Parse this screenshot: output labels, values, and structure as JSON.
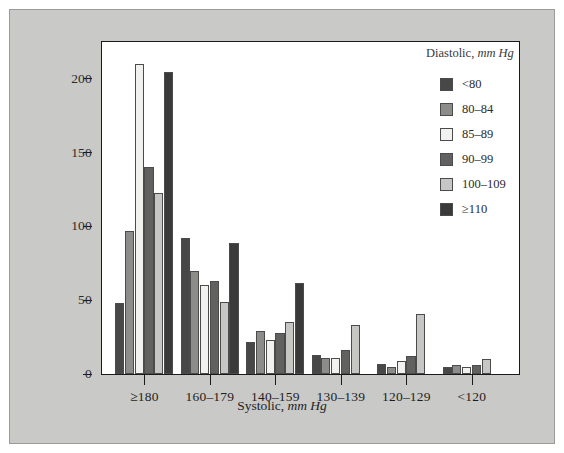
{
  "figure": {
    "background_color": "#c9c9c7",
    "plot_background_color": "#ffffff",
    "axis_color": "#1a1a1a"
  },
  "legend": {
    "title_text": "Diastolic, ",
    "title_units": "mm Hg",
    "position": "top-right-inside",
    "items": [
      {
        "label": "<80",
        "color": "#474747"
      },
      {
        "label": "80–84",
        "color": "#8c8c8a"
      },
      {
        "label": "85–89",
        "color": "#f1f1ef"
      },
      {
        "label": "90–99",
        "color": "#616160"
      },
      {
        "label": "100–109",
        "color": "#c6c6c4"
      },
      {
        "label": "≥110",
        "color": "#3a3a3a"
      }
    ]
  },
  "axes": {
    "y_ticks": [
      0,
      50,
      100,
      150,
      200
    ],
    "x_title_text": "Systolic, ",
    "x_title_units": "mm Hg"
  },
  "chart_data": {
    "type": "bar",
    "title": "",
    "xlabel": "Systolic, mm Hg",
    "ylabel": "",
    "ylim": [
      0,
      225
    ],
    "grid": false,
    "legend_position": "top-right",
    "legend_title": "Diastolic, mm Hg",
    "categories": [
      "≥180",
      "160–179",
      "140–159",
      "130–139",
      "120–129",
      "<120"
    ],
    "series": [
      {
        "name": "<80",
        "color": "#474747",
        "values": [
          48,
          92,
          22,
          13,
          7,
          5
        ]
      },
      {
        "name": "80–84",
        "color": "#8c8c8a",
        "values": [
          97,
          70,
          29,
          11,
          5,
          6
        ]
      },
      {
        "name": "85–89",
        "color": "#f1f1ef",
        "values": [
          210,
          60,
          23,
          11,
          9,
          5
        ]
      },
      {
        "name": "90–99",
        "color": "#616160",
        "values": [
          140,
          63,
          28,
          16,
          12,
          6
        ]
      },
      {
        "name": "100–109",
        "color": "#c6c6c4",
        "values": [
          123,
          49,
          35,
          33,
          41,
          10
        ]
      },
      {
        "name": "≥110",
        "color": "#3a3a3a",
        "values": [
          205,
          89,
          62,
          0,
          0,
          0
        ]
      }
    ]
  }
}
